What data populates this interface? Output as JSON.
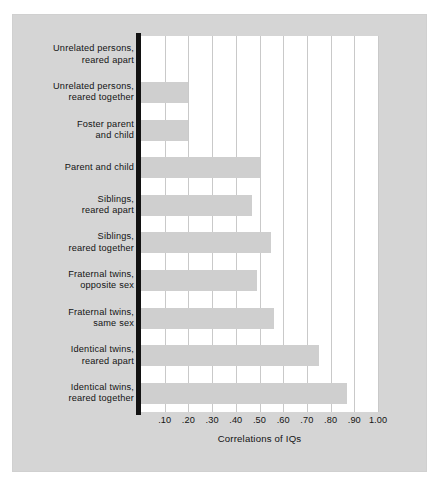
{
  "chart_data": {
    "type": "bar",
    "orientation": "horizontal",
    "title": "",
    "xlabel": "Correlations of IQs",
    "ylabel": "",
    "xlim": [
      0,
      1.0
    ],
    "grid": true,
    "legend": false,
    "xticks": [
      ".10",
      ".20",
      ".30",
      ".40",
      ".50",
      ".60",
      ".70",
      ".80",
      ".90",
      "1.00"
    ],
    "xtick_values": [
      0.1,
      0.2,
      0.3,
      0.4,
      0.5,
      0.6,
      0.7,
      0.8,
      0.9,
      1.0
    ],
    "categories": [
      "Unrelated persons,\nreared apart",
      "Unrelated persons,\nreared together",
      "Foster parent\nand child",
      "Parent and child",
      "Siblings,\nreared apart",
      "Siblings,\nreared together",
      "Fraternal twins,\nopposite sex",
      "Fraternal twins,\nsame sex",
      "Identical twins,\nreared apart",
      "Identical twins,\nreared together"
    ],
    "values": [
      0.0,
      0.2,
      0.2,
      0.5,
      0.47,
      0.55,
      0.49,
      0.56,
      0.75,
      0.87
    ],
    "bar_color": "#cfcfcf",
    "plot_background": "#ffffff",
    "panel_background": "#d5d5d5",
    "gridline_color": "#c9c9c9",
    "axis_color": "#121212"
  }
}
